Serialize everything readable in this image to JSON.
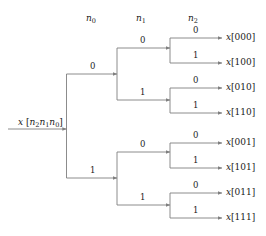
{
  "diagram": {
    "line_color": "#7f7f7f",
    "text_color": "#1a1a1a",
    "background": "#ffffff",
    "input": {
      "x_symbol": "x",
      "bracket_open": "[",
      "bracket_close": "]",
      "bits": [
        {
          "name": "n",
          "sub": "2"
        },
        {
          "name": "n",
          "sub": "1"
        },
        {
          "name": "n",
          "sub": "0"
        }
      ],
      "full_text": "x [n2n1n0]"
    },
    "columns": [
      {
        "name": "n",
        "sub": "0",
        "x": 90
      },
      {
        "name": "n",
        "sub": "1",
        "x": 140
      },
      {
        "name": "n",
        "sub": "2",
        "x": 192
      }
    ],
    "level1_branches": [
      {
        "bit": "0",
        "x": 93,
        "y": 74
      },
      {
        "bit": "1",
        "x": 93,
        "y": 178
      }
    ],
    "level2_branches": [
      {
        "bit": "0",
        "x": 143,
        "y": 48
      },
      {
        "bit": "1",
        "x": 143,
        "y": 100
      },
      {
        "bit": "0",
        "x": 143,
        "y": 152
      },
      {
        "bit": "1",
        "x": 143,
        "y": 205
      }
    ],
    "level3_branches": [
      {
        "bit": "0",
        "x": 196,
        "y": 35
      },
      {
        "bit": "1",
        "x": 196,
        "y": 60
      },
      {
        "bit": "0",
        "x": 196,
        "y": 86
      },
      {
        "bit": "1",
        "x": 196,
        "y": 111
      },
      {
        "bit": "0",
        "x": 196,
        "y": 140
      },
      {
        "bit": "1",
        "x": 196,
        "y": 165
      },
      {
        "bit": "0",
        "x": 196,
        "y": 190
      },
      {
        "bit": "1",
        "x": 196,
        "y": 216
      }
    ],
    "outputs": [
      {
        "label": "x[000]",
        "x_symbol": "x",
        "index": "[000]",
        "y": 38
      },
      {
        "label": "x[100]",
        "x_symbol": "x",
        "index": "[100]",
        "y": 63
      },
      {
        "label": "x[010]",
        "x_symbol": "x",
        "index": "[010]",
        "y": 88
      },
      {
        "label": "x[110]",
        "x_symbol": "x",
        "index": "[110]",
        "y": 113
      },
      {
        "label": "x[001]",
        "x_symbol": "x",
        "index": "[001]",
        "y": 143
      },
      {
        "label": "x[101]",
        "x_symbol": "x",
        "index": "[101]",
        "y": 168
      },
      {
        "label": "x[011]",
        "x_symbol": "x",
        "index": "[011]",
        "y": 193
      },
      {
        "label": "x[111]",
        "x_symbol": "x",
        "index": "[111]",
        "y": 218
      }
    ]
  }
}
